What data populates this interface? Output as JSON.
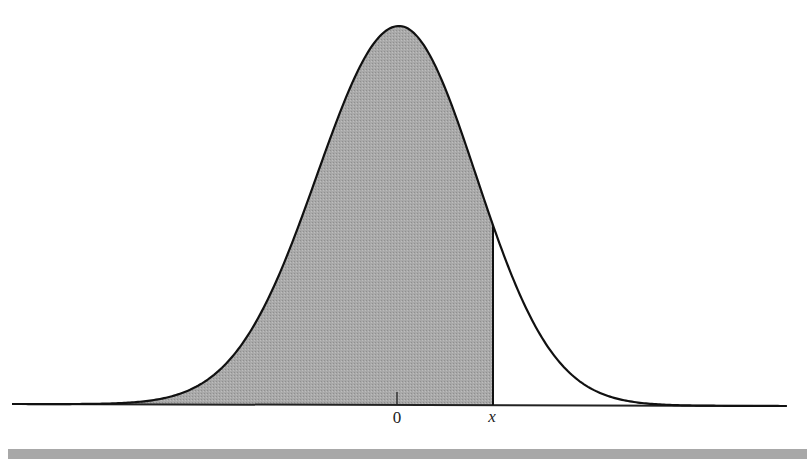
{
  "chart_data": {
    "type": "area",
    "title": "",
    "subtitle": "",
    "xlabel": "",
    "ylabel": "",
    "curve": "normal-density",
    "mean": 0,
    "sd": 1,
    "shaded_region": {
      "from": "-inf",
      "to": "x"
    },
    "x_tick_labels": [
      "0",
      "x"
    ],
    "x_ticks": [
      {
        "label": "0",
        "value": 0
      },
      {
        "label": "x",
        "value": 1.23
      }
    ],
    "grid": false,
    "legend": null,
    "colors": {
      "curve": "#111111",
      "shade": "#a6a6a6",
      "axis": "#222222",
      "bar": "#a8a8a8"
    }
  },
  "labels": {
    "zero": "0",
    "x": "x"
  }
}
